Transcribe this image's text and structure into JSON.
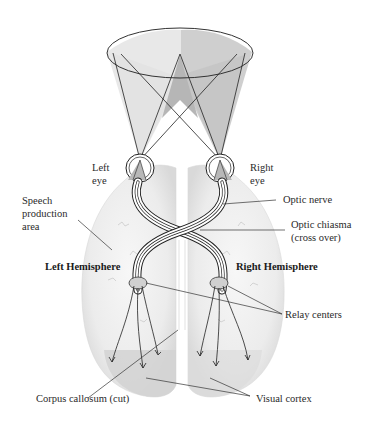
{
  "labels": {
    "left_eye": "Left\neye",
    "right_eye": "Right\neye",
    "speech_area": "Speech\nproduction\narea",
    "optic_nerve": "Optic nerve",
    "optic_chiasma": "Optic chiasma\n(cross over)",
    "left_hemisphere": "Left Hemisphere",
    "right_hemisphere": "Right Hemisphere",
    "relay_centers": "Relay centers",
    "corpus_callosum": "Corpus callosum (cut)",
    "visual_cortex": "Visual cortex"
  },
  "colors": {
    "field_left": "#e6e6e6",
    "field_right": "#c8c8c8",
    "overlap": "#b4b4b4",
    "brain": "#efefef",
    "cortex": "#d6d6d6",
    "line": "#2a2a2a"
  }
}
